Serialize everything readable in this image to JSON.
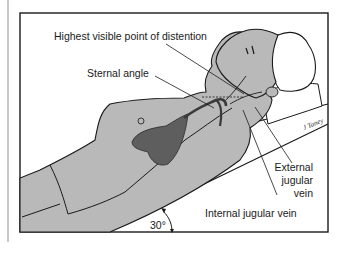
{
  "figure": {
    "labels": {
      "highest_point": "Highest visible point of distention",
      "sternal_angle": "Sternal angle",
      "external_jugular_1": "External",
      "external_jugular_2": "jugular",
      "external_jugular_3": "vein",
      "internal_jugular": "Internal jugular vein",
      "angle": "30°"
    },
    "signature": "J Taney",
    "colors": {
      "skin": "#b9b9b9",
      "heart": "#5e5e5e",
      "outline": "#1a1a1a",
      "background": "#ffffff",
      "frame": "#1a1a1a"
    }
  }
}
